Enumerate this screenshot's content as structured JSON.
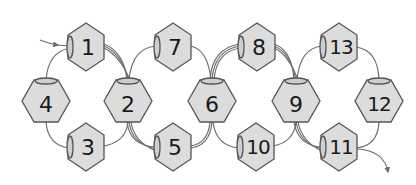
{
  "diagram": {
    "colors": {
      "bead_fill": "#dcdcdc",
      "bead_stroke": "#555555",
      "thread": "#6e6e6e",
      "label": "#1a1a1a",
      "background": "#ffffff"
    },
    "beads": [
      {
        "id": "1",
        "label": "1",
        "row": "top",
        "orientation": "vertical",
        "hole": "left"
      },
      {
        "id": "7",
        "label": "7",
        "row": "top",
        "orientation": "vertical",
        "hole": "left"
      },
      {
        "id": "8",
        "label": "8",
        "row": "top",
        "orientation": "vertical",
        "hole": "left"
      },
      {
        "id": "13",
        "label": "13",
        "row": "top",
        "orientation": "vertical",
        "hole": "left"
      },
      {
        "id": "4",
        "label": "4",
        "row": "middle",
        "orientation": "horizontal",
        "hole": "top"
      },
      {
        "id": "2",
        "label": "2",
        "row": "middle",
        "orientation": "horizontal",
        "hole": "top"
      },
      {
        "id": "6",
        "label": "6",
        "row": "middle",
        "orientation": "horizontal",
        "hole": "top"
      },
      {
        "id": "9",
        "label": "9",
        "row": "middle",
        "orientation": "horizontal",
        "hole": "top"
      },
      {
        "id": "12",
        "label": "12",
        "row": "middle",
        "orientation": "horizontal",
        "hole": "top"
      },
      {
        "id": "3",
        "label": "3",
        "row": "bottom",
        "orientation": "vertical",
        "hole": "left"
      },
      {
        "id": "5",
        "label": "5",
        "row": "bottom",
        "orientation": "vertical",
        "hole": "left"
      },
      {
        "id": "10",
        "label": "10",
        "row": "bottom",
        "orientation": "vertical",
        "hole": "left"
      },
      {
        "id": "11",
        "label": "11",
        "row": "bottom",
        "orientation": "vertical",
        "hole": "left"
      }
    ],
    "thread": {
      "start_arrow": "enters bead 1 from left",
      "end_arrow": "exits bead 11 pointing down-right"
    }
  }
}
